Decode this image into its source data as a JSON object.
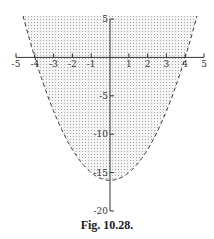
{
  "caption": "Fig. 10.28.",
  "chart_data": {
    "type": "area",
    "title": "",
    "xlabel": "",
    "ylabel": "",
    "curve": {
      "equation": "y = x^2 - 16",
      "style": "dashed",
      "vertex": [
        0,
        -16
      ],
      "x_intercepts": [
        -4,
        4
      ]
    },
    "shaded_region": "y > x^2 - 16",
    "xlim": [
      -5,
      5
    ],
    "ylim": [
      -20,
      5
    ],
    "x_ticks": [
      -5,
      -4,
      -3,
      -2,
      -1,
      0,
      1,
      2,
      3,
      4,
      5
    ],
    "x_tick_labels": [
      "-5",
      "-4",
      "-3",
      "-2",
      "-1",
      "1",
      "2",
      "3",
      "4",
      "5"
    ],
    "y_ticks": [
      5,
      0,
      -5,
      -10,
      -15,
      -20
    ],
    "y_tick_labels": [
      "5",
      "-5",
      "-10",
      "-15",
      "-20"
    ],
    "grid": false,
    "legend": null
  },
  "style": {
    "axis_color": "#333333",
    "curve_color": "#333333",
    "fill_dot_color": "#9a9a9a",
    "fill_background": "#f2f2f2"
  }
}
